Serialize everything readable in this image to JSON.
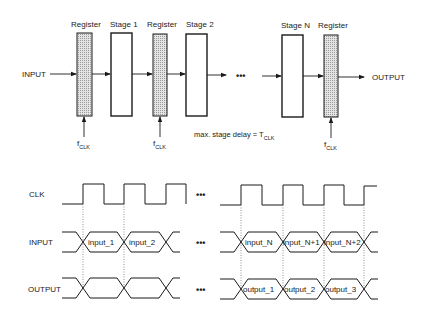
{
  "pipeline": {
    "input_label": "INPUT",
    "output_label": "OUTPUT",
    "ellipsis": "•••",
    "blocks": [
      {
        "type": "register",
        "label": "Register"
      },
      {
        "type": "stage",
        "label": "Stage 1"
      },
      {
        "type": "register",
        "label": "Register"
      },
      {
        "type": "stage",
        "label": "Stage 2"
      },
      {
        "type": "stage",
        "label": "Stage N"
      },
      {
        "type": "register",
        "label": "Register"
      }
    ],
    "clock_label_main": "f",
    "clock_label_sub": "CLK",
    "delay_note_main": "max. stage delay = T",
    "delay_note_sub": "CLK"
  },
  "timing": {
    "signals": [
      {
        "name": "CLK"
      },
      {
        "name": "INPUT",
        "values_left": [
          "input_1",
          "input_2"
        ],
        "values_right": [
          "input_N",
          "input_N+1",
          "input_N+2"
        ]
      },
      {
        "name": "OUTPUT",
        "values_left": [
          "",
          ""
        ],
        "values_right": [
          "output_1",
          "output_2",
          "output_3"
        ]
      }
    ],
    "ellipsis": "•••"
  },
  "colors": {
    "line": "#1a1a1a",
    "register_fill": "#c8c8c8",
    "dotted": "#777777"
  }
}
